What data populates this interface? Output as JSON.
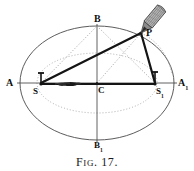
{
  "figure": {
    "caption_prefix": "F",
    "caption_smallcaps": "IG",
    "caption_suffix": ". 17.",
    "caption_full": "Fig. 17.",
    "background_color": "#ffffff",
    "ink_color": "#111111",
    "dotted_color": "#9a9a9a",
    "outline_color": "#4a4a4a",
    "pencil_color": "#6f6f6f"
  },
  "labels": {
    "vertex_left": {
      "text": "A",
      "x": 6,
      "y": 85
    },
    "vertex_right_base": {
      "text": "A",
      "sub": "1",
      "x": 178,
      "y": 85
    },
    "focus_left": {
      "text": "S",
      "x": 33,
      "y": 92
    },
    "focus_right_base": {
      "text": "S",
      "sub": "1",
      "x": 158,
      "y": 92
    },
    "minor_top": {
      "text": "B",
      "x": 96,
      "y": 17
    },
    "minor_bottom_base": {
      "text": "B",
      "sub": "1",
      "x": 96,
      "y": 137
    },
    "center": {
      "text": "C",
      "x": 97,
      "y": 86
    },
    "pencil_point": {
      "text": "P",
      "x": 146,
      "y": 28
    }
  },
  "geometry": {
    "ellipse": {
      "cx": 97,
      "cy": 83,
      "rx": 77,
      "ry": 57
    },
    "inner_dotted_ellipse": {
      "cx": 97,
      "cy": 83,
      "rx": 60,
      "ry": 30
    },
    "center_point": {
      "x": 97,
      "y": 83
    },
    "focus_left_point": {
      "x": 41,
      "y": 83
    },
    "focus_right_point": {
      "x": 155,
      "y": 83
    },
    "vertex_left_point": {
      "x": 20,
      "y": 83
    },
    "vertex_right_point": {
      "x": 174,
      "y": 83
    },
    "minor_top_point": {
      "x": 97,
      "y": 26
    },
    "minor_bottom_point": {
      "x": 97,
      "y": 140
    },
    "pencil_point_p": {
      "x": 141,
      "y": 33
    },
    "string_knot": {
      "x": 68,
      "y": 84
    }
  },
  "elements": {
    "major_axis_label": "major axis A to A1",
    "minor_axis_label": "minor axis B to B1",
    "string_label": "taut string from S to P to S1",
    "pencil_label": "pencil drawing at point P",
    "pin_left_label": "pin at focus S",
    "pin_right_label": "pin at focus S1"
  }
}
